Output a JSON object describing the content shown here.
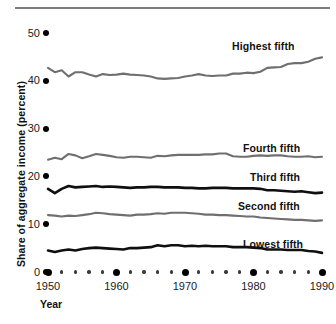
{
  "chart_data": {
    "type": "line",
    "title": "",
    "xlabel": "Year",
    "ylabel": "Share of aggregate income (percent)",
    "xlim": [
      1950,
      1990
    ],
    "ylim": [
      0,
      50
    ],
    "yticks": [
      0,
      10,
      20,
      30,
      40,
      50
    ],
    "ytick_labels": [
      "0",
      "10",
      "20",
      "30",
      "40",
      "50"
    ],
    "xticks": [
      1950,
      1960,
      1970,
      1980,
      1990
    ],
    "xtick_labels": [
      "1950",
      "1960",
      "1970",
      "1980",
      "1990"
    ],
    "minor_xtick_step": 2,
    "grid": false,
    "legend_position": "inline-right",
    "x": [
      1950,
      1951,
      1952,
      1953,
      1954,
      1955,
      1956,
      1957,
      1958,
      1959,
      1960,
      1961,
      1962,
      1963,
      1964,
      1965,
      1966,
      1967,
      1968,
      1969,
      1970,
      1971,
      1972,
      1973,
      1974,
      1975,
      1976,
      1977,
      1978,
      1979,
      1980,
      1981,
      1982,
      1983,
      1984,
      1985,
      1986,
      1987,
      1988,
      1989,
      1990
    ],
    "series": [
      {
        "name": "Highest fifth",
        "color": "#6f6f6f",
        "style": "gray",
        "values": [
          42.7,
          41.8,
          42.2,
          40.9,
          41.8,
          41.8,
          41.3,
          40.9,
          41.4,
          41.2,
          41.3,
          41.5,
          41.3,
          41.2,
          41.1,
          40.9,
          40.5,
          40.4,
          40.5,
          40.6,
          40.9,
          41.1,
          41.4,
          41.1,
          41.0,
          41.1,
          41.1,
          41.5,
          41.5,
          41.7,
          41.6,
          41.9,
          42.7,
          42.8,
          42.9,
          43.5,
          43.7,
          43.7,
          44.0,
          44.6,
          44.9
        ]
      },
      {
        "name": "Fourth fifth",
        "color": "#6f6f6f",
        "style": "gray",
        "values": [
          23.5,
          23.9,
          23.6,
          24.7,
          24.4,
          23.8,
          24.2,
          24.7,
          24.5,
          24.3,
          24.0,
          23.9,
          24.1,
          24.1,
          24.0,
          23.9,
          24.3,
          24.2,
          24.4,
          24.5,
          24.5,
          24.5,
          24.5,
          24.6,
          24.6,
          24.8,
          24.8,
          24.2,
          24.1,
          24.1,
          24.3,
          24.4,
          24.3,
          24.4,
          24.4,
          24.2,
          24.1,
          24.1,
          24.2,
          24.0,
          24.1
        ]
      },
      {
        "name": "Third fifth",
        "color": "#0f0f0f",
        "style": "black",
        "values": [
          17.4,
          16.5,
          17.4,
          18.0,
          17.7,
          17.8,
          17.9,
          18.0,
          17.8,
          17.9,
          17.8,
          17.7,
          17.6,
          17.7,
          17.7,
          17.8,
          17.8,
          17.7,
          17.7,
          17.7,
          17.6,
          17.6,
          17.5,
          17.5,
          17.6,
          17.6,
          17.6,
          17.5,
          17.5,
          17.5,
          17.5,
          17.4,
          17.1,
          17.1,
          17.0,
          16.9,
          16.8,
          16.9,
          16.7,
          16.5,
          16.6
        ]
      },
      {
        "name": "Second fifth",
        "color": "#6f6f6f",
        "style": "gray",
        "values": [
          11.9,
          11.8,
          11.6,
          11.8,
          11.7,
          11.9,
          12.1,
          12.4,
          12.3,
          12.1,
          12.0,
          11.9,
          11.8,
          12.0,
          12.0,
          12.1,
          12.3,
          12.2,
          12.4,
          12.4,
          12.4,
          12.3,
          12.2,
          12.0,
          12.0,
          11.9,
          11.9,
          11.8,
          11.7,
          11.6,
          11.6,
          11.4,
          11.3,
          11.2,
          11.1,
          11.0,
          10.9,
          10.9,
          10.8,
          10.7,
          10.8
        ]
      },
      {
        "name": "Lowest fifth",
        "color": "#0f0f0f",
        "style": "black",
        "values": [
          4.5,
          4.2,
          4.5,
          4.7,
          4.5,
          4.8,
          5.0,
          5.1,
          5.0,
          4.9,
          4.8,
          4.7,
          5.0,
          5.0,
          5.1,
          5.2,
          5.6,
          5.4,
          5.6,
          5.6,
          5.4,
          5.5,
          5.4,
          5.5,
          5.4,
          5.4,
          5.4,
          5.2,
          5.2,
          5.2,
          5.1,
          5.0,
          4.7,
          4.7,
          4.7,
          4.6,
          4.6,
          4.6,
          4.4,
          4.3,
          4.0
        ]
      }
    ]
  },
  "axis": {
    "y_title": "Share of aggregate income (percent)",
    "x_title": "Year",
    "y_ticks": [
      {
        "label": "50",
        "value": 50
      },
      {
        "label": "40",
        "value": 40
      },
      {
        "label": "30",
        "value": 30
      },
      {
        "label": "20",
        "value": 20
      },
      {
        "label": "10",
        "value": 10
      },
      {
        "label": "0",
        "value": 0
      }
    ],
    "x_ticks": [
      {
        "label": "1950",
        "value": 1950
      },
      {
        "label": "1960",
        "value": 1960
      },
      {
        "label": "1970",
        "value": 1970
      },
      {
        "label": "1980",
        "value": 1980
      },
      {
        "label": "1990",
        "value": 1990
      }
    ]
  },
  "labels": {
    "highest": "Highest fifth",
    "fourth": "Fourth fifth",
    "third": "Third fifth",
    "second": "Second fifth",
    "lowest": "Lowest fifth"
  },
  "colors": {
    "line_gray": "#6f6f6f",
    "line_black": "#0f0f0f",
    "rule": "#7d7d7d",
    "text": "#111111"
  }
}
